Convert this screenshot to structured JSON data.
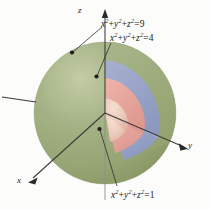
{
  "figure": {
    "background_color": "#fcfcfa"
  },
  "axes": {
    "z": {
      "label": "z",
      "direction": "up"
    },
    "y": {
      "label": "y",
      "direction": "right"
    },
    "x": {
      "label": "x",
      "direction": "lower-left"
    },
    "line_color": "#3a3a3a"
  },
  "labels": {
    "outer": {
      "lhs_x": "x",
      "lhs_y": "y",
      "lhs_z": "z",
      "exponent": "2",
      "plus": "+",
      "equals": "=",
      "value": "9",
      "text": "x² + y² + z² = 9"
    },
    "middle": {
      "lhs_x": "x",
      "lhs_y": "y",
      "lhs_z": "z",
      "exponent": "2",
      "plus": "+",
      "equals": "=",
      "value": "4",
      "text": "x² + y² + z² = 4"
    },
    "inner": {
      "lhs_x": "x",
      "lhs_y": "y",
      "lhs_z": "z",
      "exponent": "2",
      "plus": "+",
      "equals": "=",
      "value": "1",
      "text": "x² + y² + z² = 1"
    }
  },
  "shells": [
    {
      "name": "outer-sphere",
      "radius": 3,
      "color": "#9aa878",
      "shade_color": "#8a996a",
      "highlight_color": "#b3bf95"
    },
    {
      "name": "middle-sphere",
      "radius": 2,
      "color": "#8e9ac4",
      "shade_color": "#7d89b4",
      "highlight_color": "#a7b1d3"
    },
    {
      "name": "inner-sphere",
      "radius": 1,
      "color": "#e5a098",
      "shade_color": "#d88d84",
      "highlight_color": "#efb9b2"
    },
    {
      "name": "core-sphere",
      "radius": 1,
      "color": "#e8c3b4",
      "shade_color": "#dcb0a0",
      "highlight_color": "#f2d6c9"
    }
  ],
  "leader_lines": [
    {
      "name": "leader-outer",
      "from": [
        104,
        26
      ],
      "to": [
        72,
        52
      ],
      "dot": [
        72,
        52
      ]
    },
    {
      "name": "leader-middle",
      "from": [
        113,
        42
      ],
      "to": [
        96,
        76
      ],
      "dot": [
        96,
        76
      ]
    },
    {
      "name": "leader-inner",
      "from": [
        118,
        186
      ],
      "to": [
        99,
        129
      ],
      "dot": [
        99,
        129
      ]
    }
  ]
}
